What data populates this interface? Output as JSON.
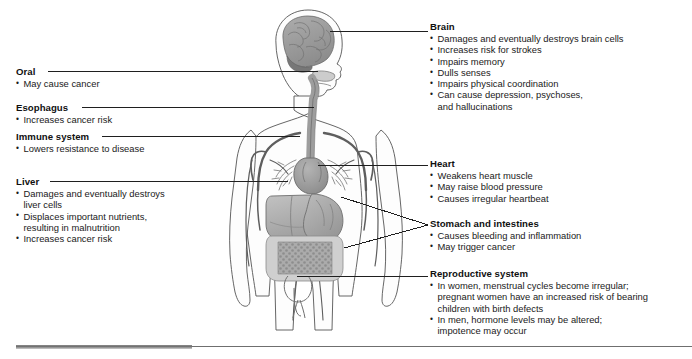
{
  "figure": {
    "colors": {
      "outline": "#4a4a4a",
      "brain_fill": "#9b9b9b",
      "brain_shadow": "#6f6f6f",
      "organ_light": "#c9c9c9",
      "organ_mid": "#a8a8a8",
      "organ_dark": "#8d8d8d",
      "vessel": "#5a5a5a",
      "body_fill": "#fbfbfb",
      "leader_line": "#2b2b2b",
      "footer_bar": "#6f6f6f"
    },
    "organs": [
      "brain",
      "esophagus",
      "heart",
      "lungs and bronchi",
      "liver",
      "stomach",
      "intestines",
      "reproductive organs",
      "circulatory vessels"
    ]
  },
  "labels": {
    "left": [
      {
        "id": "oral",
        "heading": "Oral",
        "bullets": [
          "May cause cancer"
        ]
      },
      {
        "id": "esophagus",
        "heading": "Esophagus",
        "bullets": [
          "Increases cancer risk"
        ]
      },
      {
        "id": "immune-system",
        "heading": "Immune system",
        "bullets": [
          "Lowers resistance to disease"
        ]
      },
      {
        "id": "liver",
        "heading": "Liver",
        "bullets": [
          "Damages and eventually destroys\nliver cells",
          "Displaces important nutrients,\nresulting in malnutrition",
          "Increases cancer risk"
        ]
      }
    ],
    "right": [
      {
        "id": "brain",
        "heading": "Brain",
        "bullets": [
          "Damages and eventually destroys brain cells",
          "Increases risk for strokes",
          "Impairs memory",
          "Dulls senses",
          "Impairs physical coordination",
          "Can cause depression, psychoses,\nand hallucinations"
        ]
      },
      {
        "id": "heart",
        "heading": "Heart",
        "bullets": [
          "Weakens heart muscle",
          "May raise blood pressure",
          "Causes irregular heartbeat"
        ]
      },
      {
        "id": "stomach-and-intestines",
        "heading": "Stomach and intestines",
        "bullets": [
          "Causes bleeding and inflammation",
          "May trigger cancer"
        ]
      },
      {
        "id": "reproductive-system",
        "heading": "Reproductive system",
        "bullets": [
          "In women, menstrual cycles become irregular;\npregnant women have an increased risk of bearing\nchildren with birth defects",
          "In men, hormone levels may be altered;\nimpotence may occur"
        ]
      }
    ]
  }
}
